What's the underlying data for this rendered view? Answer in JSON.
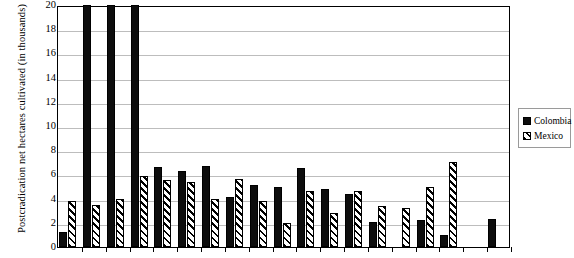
{
  "chart_data": {
    "type": "bar",
    "title": "",
    "subtitle": "",
    "xlabel": "",
    "ylabel": "Postcradication net hectares cultivated (in thousands)",
    "ylim": [
      0,
      20
    ],
    "ytick_step": 2,
    "yticks": [
      "20",
      "18",
      "16",
      "14",
      "12",
      "10",
      "8",
      "6",
      "4",
      "2",
      "0"
    ],
    "grid": true,
    "legend_position": "right-outside",
    "xticklabels": [
      "",
      "",
      "",
      "",
      "",
      "",
      "",
      "",
      "",
      "",
      "",
      "",
      "",
      "",
      "",
      "",
      "",
      "",
      ""
    ],
    "categories": [
      "1",
      "2",
      "3",
      "4",
      "5",
      "6",
      "7",
      "8",
      "9",
      "10",
      "11",
      "12",
      "13",
      "14",
      "15",
      "16",
      "17",
      "18",
      "19"
    ],
    "series": [
      {
        "name": "Colombia",
        "color": "#0d0d0d",
        "pattern": "solid",
        "values": [
          1.2,
          20.0,
          20.0,
          20.0,
          6.6,
          6.3,
          6.7,
          4.1,
          5.1,
          5.0,
          6.5,
          4.8,
          4.4,
          2.1,
          0.0,
          2.2,
          1.0,
          0.0,
          2.3
        ]
      },
      {
        "name": "Mexico",
        "color": "#ffffff",
        "pattern": "diagonal-hatch",
        "values": [
          3.8,
          3.5,
          4.0,
          5.9,
          5.5,
          5.4,
          4.0,
          5.6,
          3.8,
          2.0,
          4.6,
          2.8,
          4.6,
          3.4,
          3.2,
          5.0,
          7.0,
          0.0,
          0.0
        ]
      }
    ]
  },
  "legend": {
    "items": [
      {
        "label": "Colombia",
        "swatch": "solid-square-black-icon"
      },
      {
        "label": "Mexico",
        "swatch": "hatched-square-icon"
      }
    ]
  }
}
